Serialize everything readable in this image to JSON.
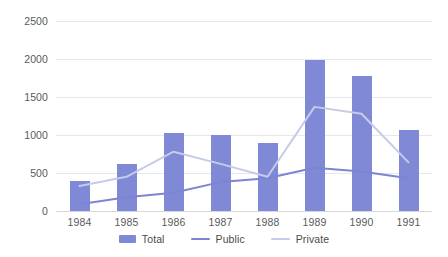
{
  "chart_data": {
    "type": "bar",
    "title": "",
    "xlabel": "",
    "ylabel": "",
    "categories": [
      "1984",
      "1985",
      "1986",
      "1987",
      "1988",
      "1989",
      "1990",
      "1991"
    ],
    "ylim": [
      0,
      2500
    ],
    "yticks": [
      0,
      500,
      1000,
      1500,
      2000,
      2500
    ],
    "ytick_labels": [
      "0",
      "500",
      "1000",
      "1500",
      "2000",
      "2500"
    ],
    "grid": true,
    "legend_position": "bottom",
    "series": [
      {
        "name": "Total",
        "kind": "bar",
        "color": "#7f89d6",
        "values": [
          400,
          620,
          1020,
          1000,
          890,
          1990,
          1780,
          1060
        ]
      },
      {
        "name": "Public",
        "kind": "line",
        "color": "#7b85d2",
        "values": [
          90,
          180,
          240,
          380,
          430,
          570,
          520,
          430
        ]
      },
      {
        "name": "Private",
        "kind": "line",
        "color": "#c6cbe9",
        "values": [
          330,
          450,
          780,
          620,
          450,
          1370,
          1280,
          640
        ]
      }
    ]
  },
  "legend": {
    "items": [
      {
        "label": "Total",
        "swatch": "bar",
        "color": "#7f89d6"
      },
      {
        "label": "Public",
        "swatch": "line",
        "color": "#7b85d2"
      },
      {
        "label": "Private",
        "swatch": "line",
        "color": "#c6cbe9"
      }
    ]
  }
}
